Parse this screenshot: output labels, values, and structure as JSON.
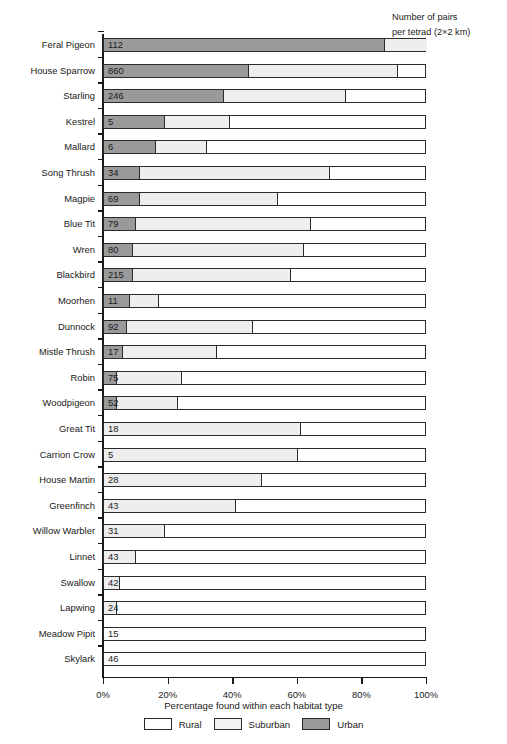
{
  "header": {
    "note_line1": "Number of pairs",
    "note_line2": "per tetrad (2×2 km)"
  },
  "axis": {
    "xlabel": "Percentage found within each habitat type",
    "xticks": [
      "0%",
      "20%",
      "40%",
      "60%",
      "80%",
      "100%"
    ]
  },
  "legend": {
    "items": [
      {
        "label": "Rural",
        "color": "#ffffff"
      },
      {
        "label": "Suburban",
        "color": "#f2f2f2"
      },
      {
        "label": "Urban",
        "color": "#9a9a9a"
      }
    ]
  },
  "chart_data": {
    "type": "bar",
    "orientation": "horizontal",
    "stacked": true,
    "title": "",
    "xlabel": "Percentage found within each habitat type",
    "ylabel": "",
    "xlim": [
      0,
      100
    ],
    "xticks": [
      0,
      20,
      40,
      60,
      80,
      100
    ],
    "grid": false,
    "legend_position": "bottom",
    "value_column_header": "Number of pairs per tetrad (2×2 km)",
    "series": [
      {
        "name": "Urban",
        "color": "#9a9a9a"
      },
      {
        "name": "Suburban",
        "color": "#f2f2f2"
      },
      {
        "name": "Rural",
        "color": "#ffffff"
      }
    ],
    "categories": [
      "Feral Pigeon",
      "House Sparrow",
      "Starling",
      "Kestrel",
      "Mallard",
      "Song Thrush",
      "Magpie",
      "Blue Tit",
      "Wren",
      "Blackbird",
      "Moorhen",
      "Dunnock",
      "Mistle Thrush",
      "Robin",
      "Woodpigeon",
      "Great Tit",
      "Carrion Crow",
      "House Martin",
      "Greenfinch",
      "Willow Warbler",
      "Linnet",
      "Swallow",
      "Lapwing",
      "Meadow Pipit",
      "Skylark"
    ],
    "rows": [
      {
        "category": "Feral Pigeon",
        "urban": 87,
        "suburban": 13,
        "rural": 0,
        "pairs": "112"
      },
      {
        "category": "House Sparrow",
        "urban": 45,
        "suburban": 46,
        "rural": 9,
        "pairs": "860"
      },
      {
        "category": "Starling",
        "urban": 37,
        "suburban": 38,
        "rural": 25,
        "pairs": "246"
      },
      {
        "category": "Kestrel",
        "urban": 19,
        "suburban": 20,
        "rural": 61,
        "pairs": "5"
      },
      {
        "category": "Mallard",
        "urban": 16,
        "suburban": 16,
        "rural": 68,
        "pairs": "6"
      },
      {
        "category": "Song Thrush",
        "urban": 11,
        "suburban": 59,
        "rural": 30,
        "pairs": "34"
      },
      {
        "category": "Magpie",
        "urban": 11,
        "suburban": 43,
        "rural": 46,
        "pairs": "69"
      },
      {
        "category": "Blue Tit",
        "urban": 10,
        "suburban": 54,
        "rural": 36,
        "pairs": "79"
      },
      {
        "category": "Wren",
        "urban": 9,
        "suburban": 53,
        "rural": 38,
        "pairs": "80"
      },
      {
        "category": "Blackbird",
        "urban": 9,
        "suburban": 49,
        "rural": 42,
        "pairs": "215"
      },
      {
        "category": "Moorhen",
        "urban": 8,
        "suburban": 9,
        "rural": 83,
        "pairs": "11"
      },
      {
        "category": "Dunnock",
        "urban": 7,
        "suburban": 39,
        "rural": 54,
        "pairs": "92"
      },
      {
        "category": "Mistle Thrush",
        "urban": 6,
        "suburban": 29,
        "rural": 65,
        "pairs": "17"
      },
      {
        "category": "Robin",
        "urban": 4,
        "suburban": 20,
        "rural": 76,
        "pairs": "75"
      },
      {
        "category": "Woodpigeon",
        "urban": 4,
        "suburban": 19,
        "rural": 77,
        "pairs": "52"
      },
      {
        "category": "Great Tit",
        "urban": 0,
        "suburban": 61,
        "rural": 39,
        "pairs": "18"
      },
      {
        "category": "Carrion Crow",
        "urban": 0,
        "suburban": 60,
        "rural": 40,
        "pairs": "5"
      },
      {
        "category": "House Martin",
        "urban": 0,
        "suburban": 49,
        "rural": 51,
        "pairs": "28"
      },
      {
        "category": "Greenfinch",
        "urban": 0,
        "suburban": 41,
        "rural": 59,
        "pairs": "43"
      },
      {
        "category": "Willow Warbler",
        "urban": 0,
        "suburban": 19,
        "rural": 81,
        "pairs": "31"
      },
      {
        "category": "Linnet",
        "urban": 0,
        "suburban": 10,
        "rural": 90,
        "pairs": "43"
      },
      {
        "category": "Swallow",
        "urban": 0,
        "suburban": 5,
        "rural": 95,
        "pairs": "42"
      },
      {
        "category": "Lapwing",
        "urban": 0,
        "suburban": 4,
        "rural": 96,
        "pairs": "24"
      },
      {
        "category": "Meadow Pipit",
        "urban": 0,
        "suburban": 0,
        "rural": 100,
        "pairs": "15"
      },
      {
        "category": "Skylark",
        "urban": 0,
        "suburban": 0,
        "rural": 100,
        "pairs": "46"
      }
    ]
  }
}
